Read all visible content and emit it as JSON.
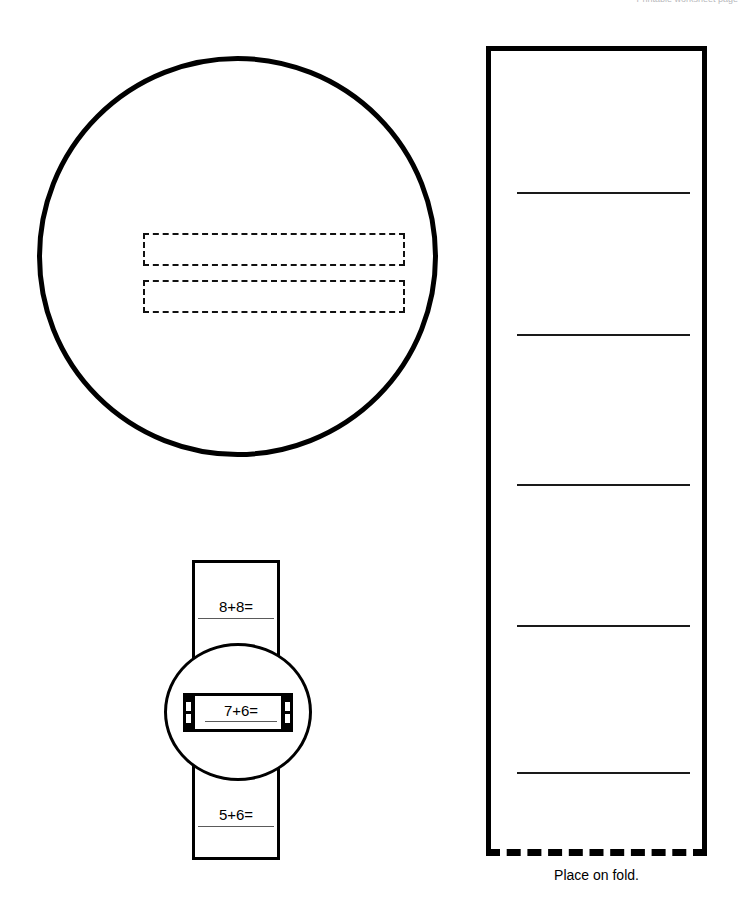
{
  "page": {
    "header_note": "Printable worksheet page",
    "background_color": "#ffffff",
    "ink_color": "#000000"
  },
  "cover_circle": {
    "name": "large circle cover",
    "dashed_slots": [
      {
        "label": ""
      },
      {
        "label": ""
      }
    ]
  },
  "fold_page": {
    "caption": "Place on fold.",
    "rules": [
      {
        "index": 1
      },
      {
        "index": 2
      },
      {
        "index": 3
      },
      {
        "index": 4
      },
      {
        "index": 5
      }
    ]
  },
  "assembly": {
    "strip_problems": [
      {
        "text": "8+8="
      },
      {
        "text": "5+6="
      }
    ],
    "slot_problem": {
      "text": "7+6="
    }
  }
}
